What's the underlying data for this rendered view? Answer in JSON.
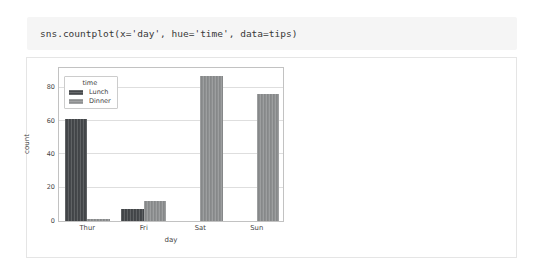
{
  "code_cell": {
    "text": "sns.countplot(x='day', hue='time', data=tips)"
  },
  "chart_data": {
    "type": "bar",
    "title": "",
    "xlabel": "day",
    "ylabel": "count",
    "categories": [
      "Thur",
      "Fri",
      "Sat",
      "Sun"
    ],
    "series": [
      {
        "name": "Lunch",
        "values": [
          61,
          7,
          0,
          0
        ],
        "color": "#45484b"
      },
      {
        "name": "Dinner",
        "values": [
          1,
          12,
          87,
          76
        ],
        "color": "#8d8f90"
      }
    ],
    "legend": {
      "title": "time",
      "position": "upper left"
    },
    "yticks": [
      0,
      20,
      40,
      60,
      80
    ],
    "ylim": [
      0,
      93
    ],
    "grid": "horizontal",
    "colors": {
      "gridline": "#dedede",
      "spine": "#c2c2c2",
      "code_background": "#f5f5f5",
      "cell_border": "#e5e5e5"
    }
  }
}
